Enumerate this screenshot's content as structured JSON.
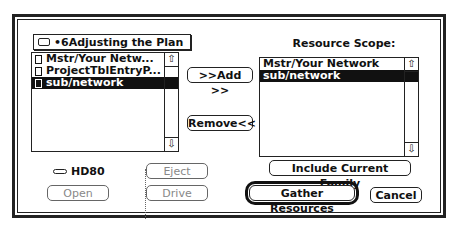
{
  "dialog": {
    "folder_popup": {
      "icon": "folder-icon",
      "label": "•6Adjusting the Plan"
    },
    "file_list": {
      "items": [
        {
          "label": "Mstr/Your Netw...",
          "icon": "document-icon",
          "selected": false
        },
        {
          "label": "ProjectTblEntryP...",
          "icon": "document-icon",
          "selected": false
        },
        {
          "label": "sub/network",
          "icon": "document-icon",
          "selected": true
        }
      ]
    },
    "add_button": ">>Add >>",
    "remove_button": "Remove<<",
    "scope_heading": "Resource Scope:",
    "scope_list": {
      "items": [
        {
          "label": "Mstr/Your Network",
          "selected": false
        },
        {
          "label": "sub/network",
          "selected": true
        }
      ]
    },
    "disk": {
      "icon": "hard-disk-icon",
      "label": "HD80"
    },
    "open_button": "Open",
    "eject_button": "Eject",
    "drive_button": "Drive",
    "include_family_button": "Include Current Family",
    "gather_button": "Gather Resources",
    "cancel_button": "Cancel",
    "scroll_up_glyph": "⇧",
    "scroll_down_glyph": "⇩"
  }
}
